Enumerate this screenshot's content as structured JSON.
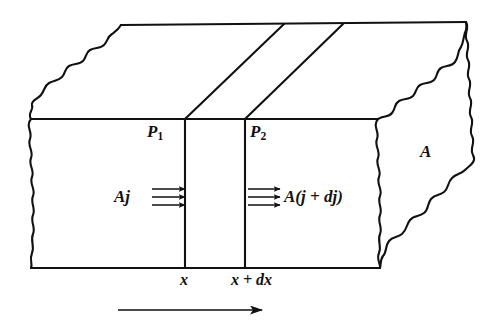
{
  "figure": {
    "kind": "diagram",
    "stroke_color": "#111111",
    "background_color": "#ffffff",
    "labels": {
      "plane_left_name": "P",
      "plane_left_subscript": "1",
      "plane_right_name": "P",
      "plane_right_subscript": "2",
      "area_label": "A",
      "flux_in": "Aj",
      "flux_out": "A(j + dj)",
      "position_left": "x",
      "position_right": "x + dx"
    },
    "arrows": {
      "flux_in_count": 3,
      "flux_out_count": 3,
      "direction_arrow_label": ""
    }
  }
}
